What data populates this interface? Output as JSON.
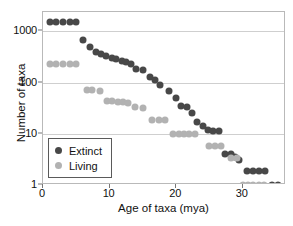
{
  "chart_data": {
    "type": "scatter",
    "title": "",
    "xlabel": "Age of taxa (mya)",
    "ylabel": "Number of taxa",
    "xlim": [
      0,
      36.5
    ],
    "ylim": [
      1,
      2400
    ],
    "yscale": "log",
    "xticks": [
      0,
      10,
      20,
      30
    ],
    "yticks": [
      1,
      10,
      100,
      1000
    ],
    "ytick_labels": [
      "1",
      "10",
      "100",
      "1000"
    ],
    "xtick_labels": [
      "0",
      "10",
      "20",
      "30"
    ],
    "grid": "horizontal",
    "legend_position": "lower-left-inside",
    "colors": {
      "extinct": "#484848",
      "living": "#b2b2b2",
      "frame": "#b9b9b9",
      "gridline": "#cfcfcf",
      "legend_border": "#5a5a5a",
      "background": "#ffffff"
    },
    "series": [
      {
        "name": "Extinct",
        "color": "#484848",
        "points": [
          [
            1,
            1500
          ],
          [
            2,
            1500
          ],
          [
            3,
            1500
          ],
          [
            4,
            1500
          ],
          [
            5,
            1500
          ],
          [
            6,
            680
          ],
          [
            7,
            490
          ],
          [
            8,
            400
          ],
          [
            8.7,
            370
          ],
          [
            9.5,
            330
          ],
          [
            10.3,
            300
          ],
          [
            11,
            290
          ],
          [
            11.8,
            270
          ],
          [
            12.5,
            250
          ],
          [
            13.2,
            230
          ],
          [
            14,
            185
          ],
          [
            15,
            175
          ],
          [
            16,
            130
          ],
          [
            16.8,
            115
          ],
          [
            17.6,
            90
          ],
          [
            19,
            70
          ],
          [
            20,
            50
          ],
          [
            20.8,
            35
          ],
          [
            21.6,
            33
          ],
          [
            22.4,
            26
          ],
          [
            23.2,
            17
          ],
          [
            24,
            14
          ],
          [
            24.8,
            12
          ],
          [
            25.6,
            11.5
          ],
          [
            26.4,
            11.5
          ],
          [
            27.4,
            4
          ],
          [
            28.2,
            4
          ],
          [
            28.8,
            3.6
          ],
          [
            29.5,
            3.1
          ],
          [
            30.6,
            1.9
          ],
          [
            31.5,
            1.9
          ],
          [
            32.4,
            1.9
          ],
          [
            33.3,
            1.9
          ],
          [
            34.4,
            1
          ],
          [
            35.3,
            1
          ]
        ]
      },
      {
        "name": "Living",
        "color": "#b2b2b2",
        "points": [
          [
            1,
            230
          ],
          [
            2,
            230
          ],
          [
            3,
            230
          ],
          [
            4,
            230
          ],
          [
            5,
            230
          ],
          [
            6.6,
            72
          ],
          [
            7.4,
            72
          ],
          [
            8.6,
            68
          ],
          [
            9.6,
            43
          ],
          [
            10.4,
            43
          ],
          [
            11.2,
            42
          ],
          [
            12,
            42
          ],
          [
            12.8,
            40
          ],
          [
            13.8,
            33
          ],
          [
            15,
            32
          ],
          [
            16.4,
            19
          ],
          [
            17.4,
            19
          ],
          [
            18.4,
            19
          ],
          [
            19.6,
            10
          ],
          [
            20.4,
            10
          ],
          [
            21.2,
            10
          ],
          [
            22,
            10
          ],
          [
            22.8,
            10
          ],
          [
            25,
            5.8
          ],
          [
            25.9,
            5.8
          ],
          [
            26.8,
            5.8
          ],
          [
            28.2,
            3.4
          ],
          [
            29.1,
            3.4
          ],
          [
            30,
            1
          ],
          [
            30.8,
            1
          ],
          [
            31.6,
            1
          ],
          [
            32.4,
            1
          ],
          [
            33.2,
            1
          ]
        ]
      }
    ]
  },
  "legend": {
    "items": [
      {
        "label": "Extinct",
        "color": "#484848"
      },
      {
        "label": "Living",
        "color": "#b2b2b2"
      }
    ]
  }
}
